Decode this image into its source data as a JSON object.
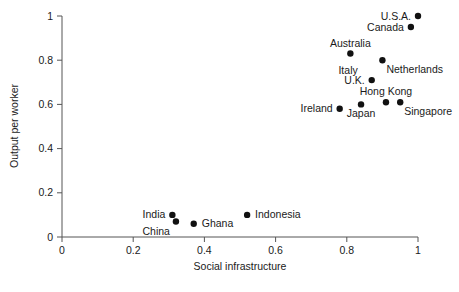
{
  "chart_data": {
    "type": "scatter",
    "title": "",
    "xlabel": "Social infrastructure",
    "ylabel": "Output per worker",
    "xlim": [
      0,
      1
    ],
    "ylim": [
      0,
      1
    ],
    "xticks": [
      "0",
      "0.2",
      "0.4",
      "0.6",
      "0.8",
      "1"
    ],
    "xtick_values": [
      0,
      0.2,
      0.4,
      0.6,
      0.8,
      1
    ],
    "yticks": [
      "0",
      "0.2",
      "0.4",
      "0.6",
      "0.8",
      "1"
    ],
    "ytick_values": [
      0,
      0.2,
      0.4,
      0.6,
      0.8,
      1
    ],
    "grid": false,
    "legend": false,
    "legend_position": "none",
    "marker": "filled-circle",
    "marker_color": "#111111",
    "points": [
      {
        "label": "U.S.A.",
        "x": 1.0,
        "y": 1.0,
        "label_pos": "left"
      },
      {
        "label": "Canada",
        "x": 0.98,
        "y": 0.95,
        "label_pos": "left"
      },
      {
        "label": "Australia",
        "x": 0.81,
        "y": 0.83,
        "label_pos": "above"
      },
      {
        "label": "Netherlands",
        "x": 0.9,
        "y": 0.8,
        "label_pos": "below-right"
      },
      {
        "label": "Italy",
        "x": 0.87,
        "y": 0.71,
        "label_pos": "above-left"
      },
      {
        "label": "U.K.",
        "x": 0.87,
        "y": 0.71,
        "label_pos": "left"
      },
      {
        "label": "Hong Kong",
        "x": 0.91,
        "y": 0.61,
        "label_pos": "above"
      },
      {
        "label": "Singapore",
        "x": 0.95,
        "y": 0.61,
        "label_pos": "below-right"
      },
      {
        "label": "Japan",
        "x": 0.84,
        "y": 0.6,
        "label_pos": "below"
      },
      {
        "label": "Ireland",
        "x": 0.78,
        "y": 0.58,
        "label_pos": "left"
      },
      {
        "label": "Indonesia",
        "x": 0.52,
        "y": 0.1,
        "label_pos": "right"
      },
      {
        "label": "India",
        "x": 0.31,
        "y": 0.1,
        "label_pos": "left"
      },
      {
        "label": "China",
        "x": 0.32,
        "y": 0.07,
        "label_pos": "below-left"
      },
      {
        "label": "Ghana",
        "x": 0.37,
        "y": 0.06,
        "label_pos": "right"
      }
    ]
  },
  "axes": {
    "x_title": "Social infrastructure",
    "y_title": "Output per worker"
  },
  "colors": {
    "marker": "#111111",
    "axis": "#555555",
    "text": "#1a1a1a",
    "background": "#ffffff"
  }
}
